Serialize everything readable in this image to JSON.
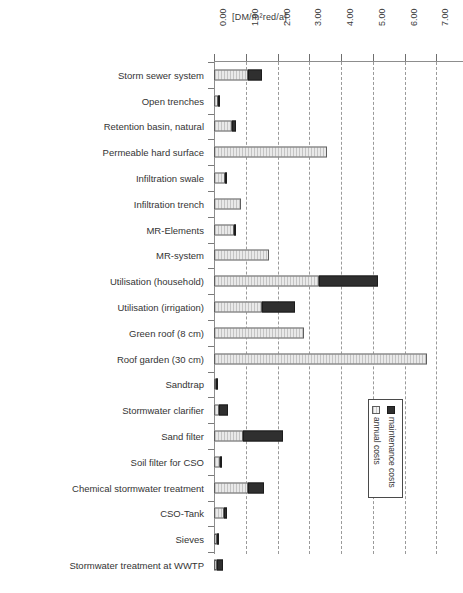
{
  "chart_data": {
    "type": "bar",
    "orientation": "horizontal",
    "stacked": true,
    "title": "",
    "xlabel": "[DM/m²red/a]",
    "ylabel": "",
    "xlim": [
      0.0,
      8.0
    ],
    "xticks": [
      "0.00",
      "1.00",
      "2.00",
      "3.00",
      "4.00",
      "5.00",
      "6.00",
      "7.00",
      "8.00"
    ],
    "xtick_values": [
      0.0,
      1.0,
      2.0,
      3.0,
      4.0,
      5.0,
      6.0,
      7.0,
      8.0
    ],
    "grid": true,
    "grid_style": "dashed vertical",
    "legend_position": "bottom-right",
    "categories": [
      "Storm sewer system",
      "Open trenches",
      "Retention basin, natural",
      "Permeable hard surface",
      "Infiltration swale",
      "Infiltration trench",
      "MR-Elements",
      "MR-system",
      "Utilisation (household)",
      "Utilisation (irrigation)",
      "Green roof (8 cm)",
      "Roof  garden (30 cm)",
      "Sandtrap",
      "Stormwater clarifier",
      "Sand filter",
      "Soil filter for CSO",
      "Chemical stormwater treatment",
      "CSO-Tank",
      "Sieves",
      "Stormwater treatment at WWTP"
    ],
    "series": [
      {
        "name": "annual costs",
        "color": "#e9e9e9",
        "values": [
          1.07,
          0.13,
          0.58,
          3.55,
          0.36,
          0.85,
          0.62,
          1.72,
          3.3,
          1.5,
          2.85,
          6.7,
          0.06,
          0.15,
          0.9,
          0.18,
          1.07,
          0.3,
          0.08,
          0.1
        ]
      },
      {
        "name": "maintenance costs",
        "color": "#2f2f2f",
        "values": [
          0.43,
          0.04,
          0.12,
          0.0,
          0.06,
          0.0,
          0.08,
          0.0,
          1.85,
          1.05,
          0.0,
          0.0,
          0.04,
          0.3,
          1.28,
          0.08,
          0.5,
          0.1,
          0.05,
          0.18
        ]
      }
    ]
  },
  "axis": {
    "unit_label": "[DM/m²red/a]"
  },
  "legend": {
    "items": [
      {
        "label": "maintenance costs",
        "swatch": "dark-square"
      },
      {
        "label": "annual costs",
        "swatch": "light-square"
      }
    ]
  }
}
